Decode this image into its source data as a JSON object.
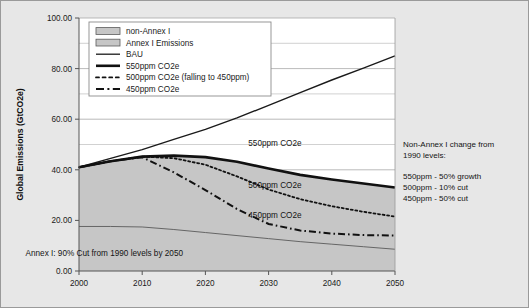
{
  "figure": {
    "background_color": "#e7e7e7",
    "plot_background_color": "#ffffff",
    "border_color": "#9a9a9a"
  },
  "chart_data": {
    "type": "area",
    "title": "",
    "subtitle": "",
    "xlabel": "",
    "ylabel": "Global Emissions (GtCO2e)",
    "xlim": [
      2000,
      2050
    ],
    "ylim": [
      0,
      100
    ],
    "xticks": [
      2000,
      2010,
      2020,
      2030,
      2040,
      2050
    ],
    "xtick_labels": [
      "2000",
      "2010",
      "2020",
      "2030",
      "2040",
      "2050"
    ],
    "yticks": [
      0,
      20,
      40,
      60,
      80,
      100
    ],
    "ytick_labels": [
      "0.00",
      "20.00",
      "40.00",
      "60.00",
      "80.00",
      "100.00"
    ],
    "minor_yticks": [
      10,
      30,
      50,
      70,
      90
    ],
    "grid": "horizontal-major-and-minor",
    "legend_position": "top-left-inside",
    "x": [
      2000,
      2005,
      2010,
      2015,
      2020,
      2025,
      2030,
      2035,
      2040,
      2045,
      2050
    ],
    "series": [
      {
        "name": "BAU",
        "kind": "line",
        "style": "solid-thin",
        "color": "#1a1a1a",
        "width": 1.4,
        "values": [
          41.0,
          44.5,
          48.0,
          52.0,
          56.0,
          60.5,
          65.5,
          70.5,
          75.5,
          80.2,
          85.0
        ]
      },
      {
        "name": "550ppm CO2e",
        "kind": "line",
        "style": "solid-thick",
        "color": "#111111",
        "width": 2.6,
        "values": [
          41.0,
          43.4,
          45.2,
          45.6,
          45.0,
          43.2,
          40.5,
          38.0,
          36.2,
          34.6,
          33.0
        ]
      },
      {
        "name": "500ppm CO2e (falling to 450ppm)",
        "kind": "line",
        "style": "dotted",
        "color": "#111111",
        "width": 1.8,
        "values": [
          41.0,
          43.4,
          45.2,
          44.6,
          42.0,
          37.4,
          32.2,
          28.4,
          25.6,
          23.4,
          21.5
        ]
      },
      {
        "name": "450ppm CO2e",
        "kind": "line",
        "style": "dash-dot",
        "color": "#111111",
        "width": 2.0,
        "values": [
          41.0,
          43.4,
          45.0,
          39.0,
          32.0,
          24.5,
          18.6,
          16.0,
          14.8,
          14.2,
          14.0
        ]
      },
      {
        "name": "Annex I Emissions",
        "kind": "area",
        "style": "filled",
        "color": "#c6c6c6",
        "edge_color": "#5a5a5a",
        "values": [
          17.6,
          17.6,
          17.4,
          16.4,
          15.2,
          14.0,
          12.8,
          11.6,
          10.6,
          9.6,
          8.6
        ]
      },
      {
        "name": "non-Annex I",
        "kind": "area",
        "style": "filled",
        "color": "#c6c6c6",
        "edge_color": "#5a5a5a",
        "values": [
          41.0,
          43.4,
          45.2,
          45.6,
          45.0,
          43.2,
          40.5,
          38.0,
          36.2,
          34.6,
          33.0
        ]
      }
    ],
    "annotations": [
      {
        "name": "label-550",
        "text": "550ppm CO2e",
        "x": 2031,
        "y": 49.5
      },
      {
        "name": "label-500",
        "text": "500ppm CO2e",
        "x": 2031,
        "y": 33.0
      },
      {
        "name": "label-450",
        "text": "450ppm CO2e",
        "x": 2031,
        "y": 21.0
      },
      {
        "name": "label-annex-cut",
        "text": "Annex I: 90% Cut from 1990 levels by 2050",
        "x": 2004,
        "y": 6.0
      }
    ]
  },
  "legend": {
    "items": [
      {
        "label": "non-Annex I",
        "marker": "swatch"
      },
      {
        "label": "Annex I Emissions",
        "marker": "swatch"
      },
      {
        "label": "BAU",
        "marker": "solid-thin"
      },
      {
        "label": "550ppm CO2e",
        "marker": "solid-thick"
      },
      {
        "label": "500ppm CO2e (falling to 450ppm)",
        "marker": "dotted"
      },
      {
        "label": "450ppm CO2e",
        "marker": "dash-dot"
      }
    ]
  },
  "side_note": {
    "heading_line1": "Non-Annex I change from",
    "heading_line2": "1990 levels:",
    "lines": [
      "550ppm - 50% growth",
      "500ppm - 10% cut",
      "450ppm - 50% cut"
    ]
  }
}
